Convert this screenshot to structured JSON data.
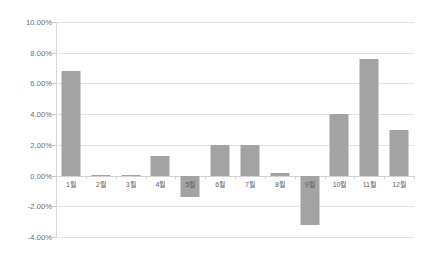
{
  "chart_data": {
    "type": "bar",
    "title": "",
    "subtitle": "",
    "xlabel": "",
    "ylabel": "",
    "categories": [
      "1월",
      "2월",
      "3월",
      "4월",
      "5월",
      "6월",
      "7월",
      "8월",
      "9월",
      "10월",
      "11월",
      "12월"
    ],
    "values": [
      6.8,
      0.05,
      0.05,
      1.3,
      -1.4,
      2.0,
      2.0,
      0.15,
      -3.2,
      4.0,
      7.6,
      3.0
    ],
    "value_format": "percent",
    "ylim": [
      -4.0,
      10.0
    ],
    "ytick_values": [
      10.0,
      8.0,
      6.0,
      4.0,
      2.0,
      0.0,
      -2.0,
      -4.0
    ],
    "ytick_labels": [
      "10.00%",
      "8.00%",
      "6.00%",
      "4.00%",
      "2.00%",
      "0.00%",
      "-2.00%",
      "-4.00%"
    ],
    "grid": true,
    "legend": false,
    "legend_position": "none",
    "series": [
      {
        "name": "",
        "values": [
          6.8,
          0.05,
          0.05,
          1.3,
          -1.4,
          2.0,
          2.0,
          0.15,
          -3.2,
          4.0,
          7.6,
          3.0
        ]
      }
    ],
    "colors": {
      "bar": "#a3a3a3",
      "gridline": "#e3e3e3",
      "zero_line": "#d2d2d2",
      "axis": "#d8d8d8",
      "background": "#ffffff",
      "tick_text": "#6d6d6d"
    }
  }
}
